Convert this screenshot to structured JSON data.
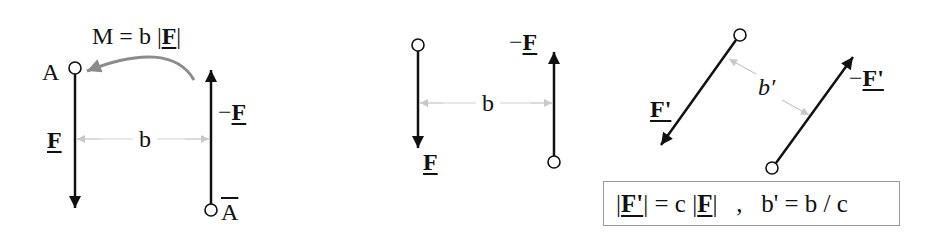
{
  "diagram": {
    "panels": [
      {
        "id": "couple",
        "labels": {
          "moment": "M = b |",
          "moment_F": "F",
          "moment_end": "|",
          "point_A": "A",
          "point_A_bar": "A",
          "force": "F",
          "neg_force_sign": "−",
          "neg_force": "F",
          "distance": "b"
        }
      },
      {
        "id": "shifted-couple",
        "labels": {
          "force": "F",
          "neg_force_sign": "−",
          "neg_force": "F",
          "distance": "b"
        }
      },
      {
        "id": "scaled-rotated-couple",
        "labels": {
          "force": "F'",
          "neg_force_sign": "−",
          "neg_force": "F'",
          "distance": "b′"
        }
      }
    ],
    "equation_box": {
      "part1_open": "|",
      "part1_F": "F'",
      "part1_mid": "| = c |",
      "part1_F2": "F",
      "part1_close": "|",
      "separator": "   ,   ",
      "part2": "b' = b / c"
    },
    "colors": {
      "force_arrow": "#111111",
      "dimension": "#bdbdbd",
      "moment_arrow": "#8c8c8c",
      "box_border": "#9a9a9a"
    }
  }
}
